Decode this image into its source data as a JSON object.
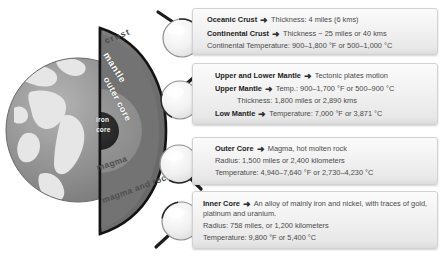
{
  "diagram": {
    "earth_labels": [
      {
        "name": "crust",
        "text": "crust"
      },
      {
        "name": "mantle",
        "text": "mantle"
      },
      {
        "name": "outer-core",
        "text": "outer core"
      },
      {
        "name": "iron-core-line1",
        "text": "iron"
      },
      {
        "name": "iron-core-line2",
        "text": "core"
      },
      {
        "name": "magma",
        "text": "magma"
      },
      {
        "name": "magma-and-rock",
        "text": "magma and rock"
      }
    ],
    "colors": {
      "crust_outline": "#1a1a1a",
      "mantle": "#6f6f6f",
      "outer_core": "#8a8a8a",
      "iron_core": "#2a2a2a",
      "globe_ocean": "#8d8d8d",
      "globe_land": "#e4e4e4",
      "box_background": "#f0f0f0",
      "box_border": "#d2d2d2",
      "body_text": "#4a4a4a",
      "heading_text": "#1b1b1b"
    }
  },
  "boxes": {
    "crust": {
      "lines": [
        {
          "bold": "Oceanic Crust",
          "arrow": "➜",
          "rest": "Thickness: 4 miles (6 kms)"
        },
        {
          "bold": "Continental Crust",
          "arrow": "➜",
          "rest": "Thickness ~ 25 miles or 40 kms"
        },
        {
          "bold": "",
          "arrow": "",
          "rest": "Continental Temperature: 900–1,800 °F or 500–1,000 °C"
        }
      ]
    },
    "mantle": {
      "lines": [
        {
          "bold": "Upper and Lower Mantle",
          "arrow": "➜",
          "rest": "Tectonic plates motion"
        },
        {
          "bold": "Upper Mantle",
          "arrow": "➜",
          "rest": "Temp.: 900–1,700 °F or 500–900 °C"
        },
        {
          "bold": "",
          "arrow": "",
          "rest": "Thickness: 1,800 miles or 2,890 kms"
        },
        {
          "bold": "Low Mantle",
          "arrow": "➜",
          "rest": "Temperature: 7,000 °F or  3,871 °C"
        }
      ]
    },
    "outer_core": {
      "lines": [
        {
          "bold": "Outer Core",
          "arrow": "➜",
          "rest": "Magma, hot molten rock"
        },
        {
          "bold": "",
          "arrow": "",
          "rest": "Radius: 1,500 miles or 2,400 kilometers"
        },
        {
          "bold": "",
          "arrow": "",
          "rest": "Temperature: 4,940–7,640 °F or 2,730–4,230 °C"
        }
      ]
    },
    "inner_core": {
      "lines": [
        {
          "bold": "Inner Core",
          "arrow": "➜",
          "rest": "An alloy of mainly iron and nickel, with traces of gold, platinum and uranium."
        },
        {
          "bold": "",
          "arrow": "",
          "rest": "Radius: 758 miles, or 1,200 kilometers"
        },
        {
          "bold": "",
          "arrow": "",
          "rest": "Temperature: 9,800 °F or 5,400 °C"
        }
      ]
    }
  },
  "magnifiers": [
    {
      "name": "magnifier-crust",
      "handle": "top-left"
    },
    {
      "name": "magnifier-mantle",
      "handle": "top-right"
    },
    {
      "name": "magnifier-outer-core",
      "handle": "bottom-right"
    },
    {
      "name": "magnifier-inner-core",
      "handle": "bottom-left"
    }
  ]
}
